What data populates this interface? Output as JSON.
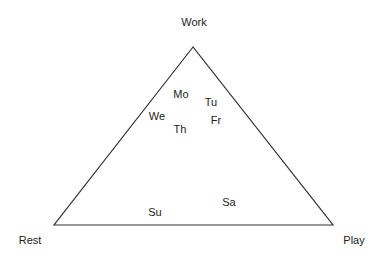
{
  "diagram": {
    "type": "ternary",
    "triangle": {
      "apex": [
        193,
        47
      ],
      "left": [
        54,
        225
      ],
      "right": [
        333,
        225
      ],
      "stroke": "#333333"
    },
    "vertices": [
      {
        "id": "work",
        "label": "Work",
        "x": 194,
        "y": 22
      },
      {
        "id": "rest",
        "label": "Rest",
        "x": 30,
        "y": 240
      },
      {
        "id": "play",
        "label": "Play",
        "x": 354,
        "y": 240
      }
    ],
    "points": [
      {
        "id": "mo",
        "label": "Mo",
        "x": 181,
        "y": 94
      },
      {
        "id": "tu",
        "label": "Tu",
        "x": 211,
        "y": 102
      },
      {
        "id": "we",
        "label": "We",
        "x": 157,
        "y": 116
      },
      {
        "id": "fr",
        "label": "Fr",
        "x": 216,
        "y": 120
      },
      {
        "id": "th",
        "label": "Th",
        "x": 180,
        "y": 129
      },
      {
        "id": "sa",
        "label": "Sa",
        "x": 229,
        "y": 202
      },
      {
        "id": "su",
        "label": "Su",
        "x": 155,
        "y": 212
      }
    ]
  }
}
